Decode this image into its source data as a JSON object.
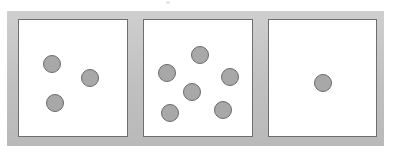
{
  "figure": {
    "canvas": {
      "width": 393,
      "height": 164
    },
    "colors": {
      "background": "#ffffff",
      "frame": "#c3c3c3",
      "box_fill": "#ffffff",
      "box_border": "#6e6e6e",
      "circle_fill": "#a8a8a8",
      "circle_border": "#6b6b6b"
    },
    "frame": {
      "x": 7,
      "y": 11,
      "width": 377,
      "height": 135
    },
    "artifact": {
      "name": "scan-speck",
      "x": 166,
      "y": 1,
      "width": 4,
      "height": 3
    },
    "panels": [
      {
        "name": "panel-left",
        "count": 3,
        "count_label": "3",
        "box": {
          "x": 18,
          "y": 19,
          "width": 110,
          "height": 118
        },
        "circles": [
          {
            "cx": 52,
            "cy": 64,
            "r": 9
          },
          {
            "cx": 90,
            "cy": 78,
            "r": 9
          },
          {
            "cx": 55,
            "cy": 103,
            "r": 9
          }
        ]
      },
      {
        "name": "panel-middle",
        "count": 6,
        "count_label": "6",
        "box": {
          "x": 143,
          "y": 19,
          "width": 110,
          "height": 118
        },
        "circles": [
          {
            "cx": 200,
            "cy": 55,
            "r": 9
          },
          {
            "cx": 167,
            "cy": 73,
            "r": 9
          },
          {
            "cx": 230,
            "cy": 77,
            "r": 9
          },
          {
            "cx": 192,
            "cy": 92,
            "r": 9
          },
          {
            "cx": 223,
            "cy": 110,
            "r": 9
          },
          {
            "cx": 170,
            "cy": 113,
            "r": 9
          }
        ]
      },
      {
        "name": "panel-right",
        "count": 1,
        "count_label": "1",
        "box": {
          "x": 268,
          "y": 19,
          "width": 109,
          "height": 118
        },
        "circles": [
          {
            "cx": 323,
            "cy": 83,
            "r": 9
          }
        ]
      }
    ]
  }
}
